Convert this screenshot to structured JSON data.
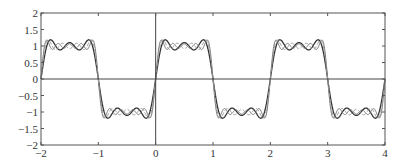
{
  "chart_data": {
    "type": "line",
    "title": "",
    "xlabel": "",
    "ylabel": "",
    "xlim": [
      -2,
      4
    ],
    "ylim": [
      -2,
      2
    ],
    "grid": false,
    "legend": null,
    "x_ticks": [
      -2,
      -1,
      0,
      1,
      2,
      3,
      4
    ],
    "x_tick_labels": [
      "−2",
      "−1",
      "0",
      "1",
      "2",
      "3",
      "4"
    ],
    "y_ticks": [
      2,
      1.5,
      1,
      0.5,
      0,
      -0.5,
      -1,
      -1.5,
      -2
    ],
    "y_tick_labels": [
      "2",
      "1.5",
      "1",
      "0.5",
      "0",
      "−0.5",
      "−1",
      "−1.5",
      "−2"
    ],
    "series": [
      {
        "name": "partial sum (3 terms)",
        "terms": 3,
        "style": "solid",
        "color": "#333333",
        "width": 1.3
      },
      {
        "name": "partial sum (5 terms)",
        "terms": 5,
        "style": "solid",
        "color": "#777777",
        "width": 1.0
      },
      {
        "name": "partial sum (4 terms)",
        "terms": 4,
        "style": "dashed",
        "color": "#999999",
        "width": 1.0
      }
    ],
    "reference_lines": [
      {
        "orientation": "horizontal",
        "value": 0
      },
      {
        "orientation": "vertical",
        "value": 0
      }
    ]
  },
  "axis_color": "#555555"
}
